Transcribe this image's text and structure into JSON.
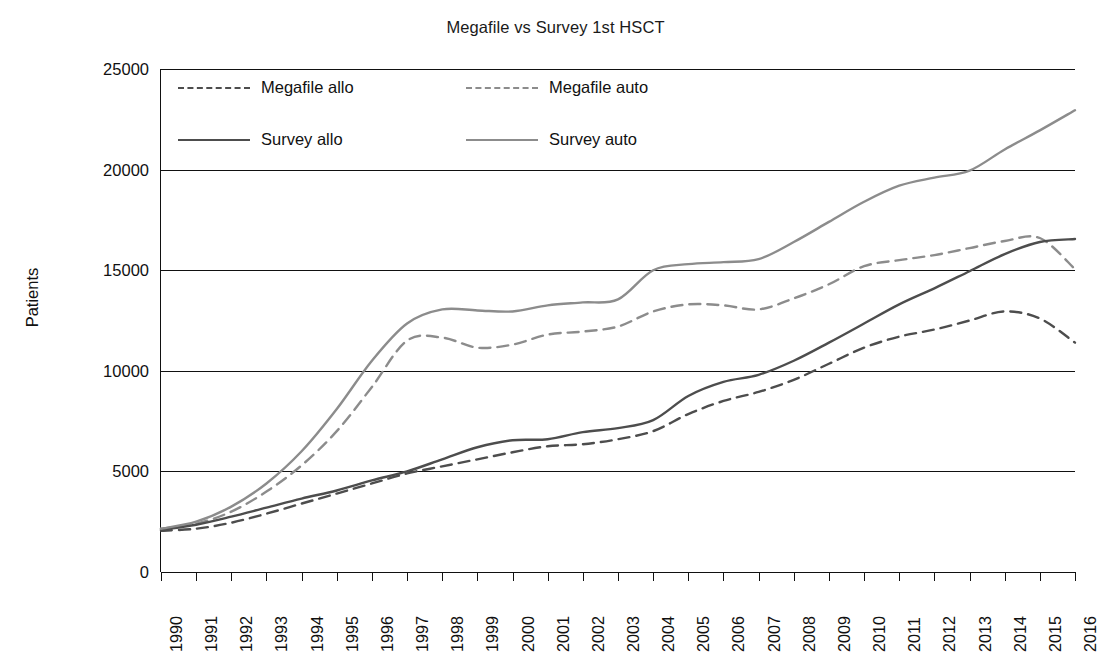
{
  "chart": {
    "title": "Megafile vs Survey 1st HSCT",
    "ylabel": "Patients"
  },
  "legend": {
    "items": [
      {
        "label": "Megafile allo",
        "style": "dashed",
        "color": "#4d4d4d"
      },
      {
        "label": "Megafile auto",
        "style": "dashed",
        "color": "#8c8c8c"
      },
      {
        "label": "Survey allo",
        "style": "solid",
        "color": "#4d4d4d"
      },
      {
        "label": "Survey auto",
        "style": "solid",
        "color": "#8c8c8c"
      }
    ]
  },
  "chart_data": {
    "type": "line",
    "title": "Megafile vs Survey 1st HSCT",
    "xlabel": "",
    "ylabel": "Patients",
    "ylim": [
      0,
      25000
    ],
    "yticks": [
      0,
      5000,
      10000,
      15000,
      20000,
      25000
    ],
    "ytick_labels": [
      "0",
      "5000",
      "10000",
      "15000",
      "20000",
      "25000"
    ],
    "grid": true,
    "legend_position": "top-left-inside",
    "categories": [
      "1990",
      "1991",
      "1992",
      "1993",
      "1994",
      "1995",
      "1996",
      "1997",
      "1998",
      "1999",
      "2000",
      "2001",
      "2002",
      "2003",
      "2004",
      "2005",
      "2006",
      "2007",
      "2008",
      "2009",
      "2010",
      "2011",
      "2012",
      "2013",
      "2014",
      "2015",
      "2016"
    ],
    "series": [
      {
        "name": "Megafile allo",
        "style": "dashed",
        "color": "#4d4d4d",
        "values": [
          2050,
          2150,
          2450,
          2900,
          3400,
          3900,
          4400,
          4900,
          5250,
          5600,
          5950,
          6250,
          6350,
          6600,
          7000,
          7850,
          8500,
          8950,
          9550,
          10350,
          11150,
          11700,
          12050,
          12500,
          12950,
          12600,
          11400
        ]
      },
      {
        "name": "Megafile auto",
        "style": "dashed",
        "color": "#8c8c8c",
        "values": [
          2150,
          2400,
          3000,
          4000,
          5300,
          7000,
          9200,
          11500,
          11650,
          11150,
          11300,
          11800,
          11950,
          12200,
          12950,
          13300,
          13250,
          13050,
          13600,
          14300,
          15200,
          15500,
          15750,
          16100,
          16450,
          16600,
          15050
        ]
      },
      {
        "name": "Survey allo",
        "style": "solid",
        "color": "#4d4d4d",
        "values": [
          2100,
          2350,
          2750,
          3200,
          3650,
          4050,
          4550,
          5000,
          5600,
          6200,
          6550,
          6600,
          6950,
          7150,
          7550,
          8750,
          9450,
          9800,
          10500,
          11400,
          12350,
          13300,
          14100,
          14950,
          15800,
          16400,
          16550
        ]
      },
      {
        "name": "Survey auto",
        "style": "solid",
        "color": "#8c8c8c",
        "values": [
          2150,
          2500,
          3250,
          4400,
          6000,
          8100,
          10500,
          12350,
          13050,
          13000,
          12950,
          13250,
          13400,
          13550,
          15000,
          15300,
          15400,
          15550,
          16400,
          17400,
          18400,
          19200,
          19600,
          19950,
          21000,
          21950,
          22950
        ]
      }
    ]
  }
}
